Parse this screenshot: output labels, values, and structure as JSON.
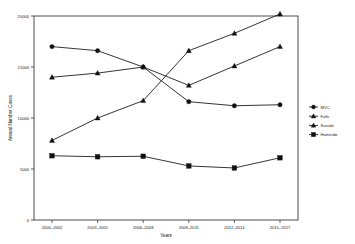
{
  "chart_data": {
    "type": "line",
    "title": "",
    "xlabel": "Years",
    "ylabel": "Annual Number Cases",
    "categories": [
      "2000–2002",
      "2003–2005",
      "2006–2008",
      "2009–2011",
      "2012–2014",
      "2015–2017"
    ],
    "ylim": [
      0,
      20000
    ],
    "yticks": [
      0,
      5000,
      10000,
      15000,
      20000
    ],
    "ytick_labels": [
      "0",
      "5000",
      "10000",
      "15000",
      "20000"
    ],
    "grid": false,
    "legend_position": "right",
    "series": [
      {
        "name": "MVC",
        "marker": "circle",
        "values": [
          17000,
          16600,
          15000,
          11600,
          11200,
          11300
        ]
      },
      {
        "name": "Falls",
        "marker": "triangle",
        "values": [
          14000,
          14400,
          15000,
          13200,
          15100,
          17000
        ]
      },
      {
        "name": "Suicide",
        "marker": "triangle",
        "values": [
          7800,
          10000,
          11700,
          16600,
          18300,
          20200
        ]
      },
      {
        "name": "Homicide",
        "marker": "square",
        "values": [
          6300,
          6200,
          6250,
          5300,
          5100,
          6100
        ]
      }
    ]
  },
  "legend": {
    "entries": [
      {
        "label": "MVC"
      },
      {
        "label": "Falls"
      },
      {
        "label": "Suicide"
      },
      {
        "label": "Homicide"
      }
    ]
  }
}
